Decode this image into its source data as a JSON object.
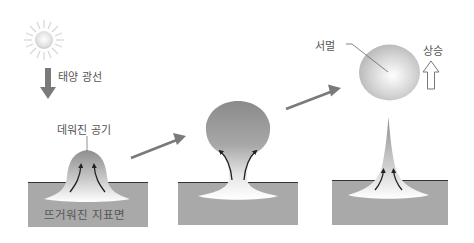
{
  "diagram": {
    "title": "",
    "type": "process-flow",
    "labels": {
      "sunlight": "태양 광선",
      "warmed_air": "데워진 공기",
      "heated_surface": "뜨거워진 지표면",
      "thermal": "서멀",
      "rising": "상승"
    },
    "stages": [
      {
        "id": 1,
        "description": "warmed air dome over heated surface"
      },
      {
        "id": 2,
        "description": "air mass forming bulbous bubble"
      },
      {
        "id": 3,
        "description": "thermal bubble detaches and rises"
      }
    ],
    "icons": {
      "sun": "sun-icon",
      "sunlight_arrow": "arrow-down-icon",
      "transition_arrow": "arrow-right-up-icon",
      "rising_arrow": "arrow-up-outline-icon"
    },
    "colors": {
      "ground": "#a9a9a9",
      "ground_line": "#333333",
      "arrow": "#7a7a7a",
      "air_dark": "#8f8f8f",
      "air_light": "#ffffff",
      "flow_arrow": "#222222"
    }
  }
}
